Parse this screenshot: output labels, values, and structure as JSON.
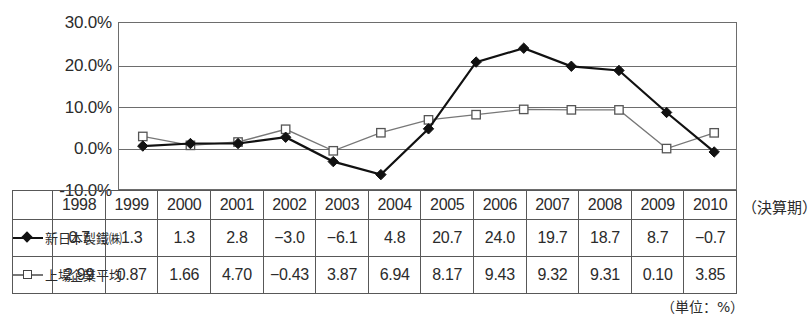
{
  "chart_data": {
    "type": "line",
    "title": "",
    "xlabel": "(決算期)",
    "ylabel": "",
    "unit_note": "（単位：%）",
    "period_note": "（決算期）",
    "categories": [
      "1998",
      "1999",
      "2000",
      "2001",
      "2002",
      "2003",
      "2004",
      "2005",
      "2006",
      "2007",
      "2008",
      "2009",
      "2010"
    ],
    "ylim": [
      -10,
      30
    ],
    "yticks": [
      "30.0%",
      "20.0%",
      "10.0%",
      "0.0%",
      "-10.0%"
    ],
    "ytick_values": [
      30,
      20,
      10,
      0,
      -10
    ],
    "grid": true,
    "legend_position": "row-header-left",
    "series": [
      {
        "name": "新日本製鐵㈱",
        "marker": "filled-diamond",
        "color": "#111111",
        "values": [
          0.7,
          1.3,
          1.3,
          2.8,
          -3.0,
          -6.1,
          4.8,
          20.7,
          24.0,
          19.7,
          18.7,
          8.7,
          -0.7
        ],
        "labels": [
          "0.7",
          "1.3",
          "1.3",
          "2.8",
          "−3.0",
          "−6.1",
          "4.8",
          "20.7",
          "24.0",
          "19.7",
          "18.7",
          "8.7",
          "−0.7"
        ]
      },
      {
        "name": "上場企業平均",
        "marker": "open-square",
        "color": "#777777",
        "values": [
          2.99,
          0.87,
          1.66,
          4.7,
          -0.43,
          3.87,
          6.94,
          8.17,
          9.43,
          9.32,
          9.31,
          0.1,
          3.85
        ],
        "labels": [
          "2.99",
          "0.87",
          "1.66",
          "4.70",
          "−0.43",
          "3.87",
          "6.94",
          "8.17",
          "9.43",
          "9.32",
          "9.31",
          "0.10",
          "3.85"
        ]
      }
    ]
  },
  "colors": {
    "series1": "#111111",
    "series2": "#777777",
    "grid": "#6d6d6d",
    "border": "#585858",
    "text": "#2b2b2b",
    "background": "#ffffff"
  }
}
